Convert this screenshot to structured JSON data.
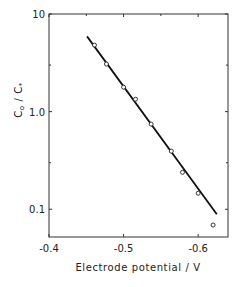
{
  "chart_data": {
    "type": "scatter",
    "title": "",
    "xlabel": "Electrode potential / V",
    "ylabel": "C₀ / C∗",
    "ylabel_parts": {
      "num": "C",
      "num_sub": "o",
      "den": "C",
      "den_sub": "*"
    },
    "xlim": [
      -0.4,
      -0.64
    ],
    "ylim": [
      0.052,
      10
    ],
    "yscale": "log",
    "grid": false,
    "legend": null,
    "x_ticks": [
      {
        "value": -0.4,
        "label": "-0.4"
      },
      {
        "value": -0.5,
        "label": "-0.5"
      },
      {
        "value": -0.6,
        "label": "-0.6"
      }
    ],
    "y_ticks": [
      {
        "value": 10,
        "label": "10"
      },
      {
        "value": 1.0,
        "label": "1.0"
      },
      {
        "value": 0.1,
        "label": "0.1"
      }
    ],
    "series": [
      {
        "name": "measured",
        "marker": "open-circle",
        "x": [
          -0.461,
          -0.477,
          -0.5,
          -0.516,
          -0.537,
          -0.564,
          -0.579,
          -0.6,
          -0.62
        ],
        "y": [
          4.8,
          3.07,
          1.78,
          1.34,
          0.745,
          0.394,
          0.239,
          0.146,
          0.069
        ]
      },
      {
        "name": "fit",
        "style": "line",
        "x": [
          -0.451,
          -0.625
        ],
        "y": [
          5.9,
          0.089
        ]
      }
    ]
  },
  "colors": {
    "ink": "#222222",
    "background": "#ffffff"
  }
}
